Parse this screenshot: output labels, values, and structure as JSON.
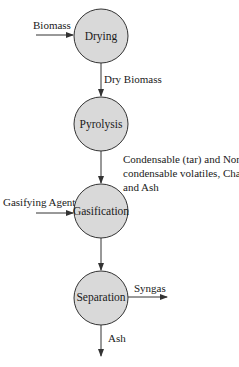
{
  "diagram": {
    "type": "process-flow",
    "nodes": [
      {
        "id": "drying",
        "label": "Drying"
      },
      {
        "id": "pyrolysis",
        "label": "Pyrolysis"
      },
      {
        "id": "gasification",
        "label": "Gasification"
      },
      {
        "id": "separation",
        "label": "Separation"
      }
    ],
    "edges": [
      {
        "from": "input",
        "to": "drying",
        "label": "Biomass"
      },
      {
        "from": "drying",
        "to": "pyrolysis",
        "label": "Dry Biomass"
      },
      {
        "from": "pyrolysis",
        "to": "gasification",
        "label_lines": [
          "Condensable (tar) and Non-",
          "condensable volatiles, Char",
          "and Ash"
        ]
      },
      {
        "from": "input",
        "to": "gasification",
        "label": "Gasifying Agent"
      },
      {
        "from": "gasification",
        "to": "separation",
        "label": ""
      },
      {
        "from": "separation",
        "to": "output",
        "label": "Syngas"
      },
      {
        "from": "separation",
        "to": "output",
        "label": "Ash"
      }
    ],
    "colors": {
      "node_fill": "#d9d9d9",
      "stroke": "#333333"
    }
  }
}
